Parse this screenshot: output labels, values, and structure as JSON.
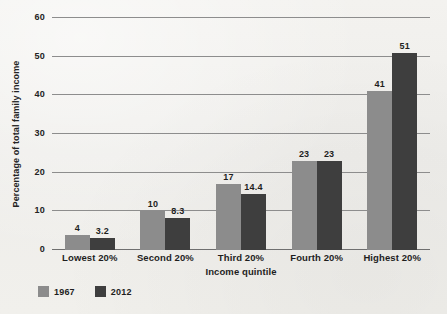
{
  "chart_data": {
    "type": "bar",
    "title": "",
    "subtitle": "",
    "xlabel": "Income quintile",
    "ylabel": "Percentage of total family income",
    "categories": [
      "Lowest 20%",
      "Second 20%",
      "Third 20%",
      "Fourth 20%",
      "Highest 20%"
    ],
    "series": [
      {
        "name": "1967",
        "color": "#8c8c8c",
        "values": [
          4,
          10,
          17,
          23,
          41
        ],
        "value_labels": [
          "4",
          "10",
          "17",
          "23",
          "41"
        ]
      },
      {
        "name": "2012",
        "color": "#3e3e3e",
        "values": [
          3.2,
          8.3,
          14.4,
          23,
          51
        ],
        "value_labels": [
          "3.2",
          "8.3",
          "14.4",
          "23",
          "51"
        ]
      }
    ],
    "ylim": [
      0,
      60
    ],
    "yticks": [
      0,
      10,
      20,
      30,
      40,
      50,
      60
    ],
    "ytick_labels": [
      "0",
      "10",
      "20",
      "30",
      "40",
      "50",
      "60"
    ],
    "grid": "horizontal",
    "legend_position": "bottom-left",
    "gridline_color": "#8d8d8d",
    "background_color": "#f1f0ed",
    "text_color": "#1e1e1e"
  }
}
